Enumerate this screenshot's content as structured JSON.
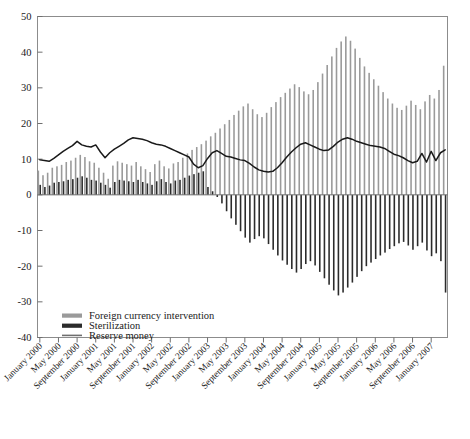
{
  "chart_data": {
    "type": "bar",
    "title": "",
    "xlabel": "",
    "ylabel": "",
    "ylim": [
      -40,
      50
    ],
    "yticks": [
      -40,
      -30,
      -20,
      -10,
      0,
      10,
      20,
      30,
      40,
      50
    ],
    "ytick_labels": [
      "-40",
      "-30",
      "-20",
      "-10",
      "0",
      "10",
      "20",
      "30",
      "40",
      "50"
    ],
    "grid": false,
    "legend_position": "lower-left-inside",
    "x_tick_interval_months": 4,
    "x": [
      "January 2000",
      "February 2000",
      "March 2000",
      "April 2000",
      "May 2000",
      "June 2000",
      "July 2000",
      "August 2000",
      "September 2000",
      "October 2000",
      "November 2000",
      "December 2000",
      "January 2001",
      "February 2001",
      "March 2001",
      "April 2001",
      "May 2001",
      "June 2001",
      "July 2001",
      "August 2001",
      "September 2001",
      "October 2001",
      "November 2001",
      "December 2001",
      "January 2002",
      "February 2002",
      "March 2002",
      "April 2002",
      "May 2002",
      "June 2002",
      "July 2002",
      "August 2002",
      "September 2002",
      "October 2002",
      "November 2002",
      "December 2002",
      "January 2003",
      "February 2003",
      "March 2003",
      "April 2003",
      "May 2003",
      "June 2003",
      "July 2003",
      "August 2003",
      "September 2003",
      "October 2003",
      "November 2003",
      "December 2003",
      "January 2004",
      "February 2004",
      "March 2004",
      "April 2004",
      "May 2004",
      "June 2004",
      "July 2004",
      "August 2004",
      "September 2004",
      "October 2004",
      "November 2004",
      "December 2004",
      "January 2005",
      "February 2005",
      "March 2005",
      "April 2005",
      "May 2005",
      "June 2005",
      "July 2005",
      "August 2005",
      "September 2005",
      "October 2005",
      "November 2005",
      "December 2005",
      "January 2006",
      "February 2006",
      "March 2006",
      "April 2006",
      "May 2006",
      "June 2006",
      "July 2006",
      "August 2006",
      "September 2006",
      "October 2006",
      "November 2006",
      "December 2006",
      "January 2007",
      "February 2007",
      "March 2007",
      "April 2007"
    ],
    "xtick_labels": [
      "January 2000",
      "May 2000",
      "September 2000",
      "January 2001",
      "May 2001",
      "September 2001",
      "January 2002",
      "May 2002",
      "September 2002",
      "January 2003",
      "May 2003",
      "September 2003",
      "January 2004",
      "May 2004",
      "September 2004",
      "January 2005",
      "May 2005",
      "September 2005",
      "January 2006",
      "May 2006",
      "September 2006",
      "January 2007"
    ],
    "series": [
      {
        "name": "Foreign currency intervention",
        "kind": "bar",
        "color": "#9a9a9a",
        "values": [
          6.8,
          5.5,
          6.2,
          7.6,
          8.0,
          8.4,
          9.2,
          9.6,
          10.4,
          11.2,
          10.6,
          9.4,
          9.0,
          7.6,
          6.2,
          4.5,
          8.2,
          9.4,
          9.0,
          8.6,
          8.2,
          9.2,
          8.0,
          7.2,
          6.4,
          8.6,
          9.6,
          8.0,
          7.4,
          8.8,
          9.2,
          10.4,
          11.6,
          12.6,
          13.4,
          14.2,
          15.2,
          16.4,
          17.4,
          18.6,
          19.8,
          21.0,
          22.4,
          23.6,
          24.8,
          25.6,
          24.0,
          22.6,
          21.8,
          23.0,
          24.6,
          26.0,
          27.4,
          28.6,
          29.8,
          31.0,
          30.2,
          29.0,
          28.2,
          29.4,
          31.6,
          34.0,
          36.4,
          38.8,
          41.2,
          43.0,
          44.4,
          43.2,
          41.0,
          38.4,
          36.0,
          34.2,
          32.4,
          30.6,
          28.8,
          27.0,
          25.6,
          24.4,
          23.8,
          25.0,
          26.4,
          25.2,
          24.0,
          26.2,
          28.0,
          27.0,
          29.4,
          36.2
        ]
      },
      {
        "name": "Sterilization",
        "kind": "bar",
        "color": "#2b2b2b",
        "values": [
          2.8,
          2.2,
          2.6,
          3.4,
          3.6,
          3.8,
          4.2,
          4.4,
          4.8,
          5.2,
          4.8,
          4.2,
          4.0,
          3.4,
          2.8,
          2.0,
          3.6,
          4.2,
          4.0,
          3.8,
          3.6,
          4.2,
          3.6,
          3.2,
          2.8,
          3.8,
          4.4,
          3.6,
          3.2,
          4.0,
          4.2,
          4.8,
          5.4,
          5.8,
          6.2,
          6.6,
          2.2,
          1.0,
          -0.6,
          -2.4,
          -4.6,
          -6.6,
          -8.4,
          -10.2,
          -12.0,
          -13.4,
          -12.4,
          -11.6,
          -12.2,
          -13.8,
          -15.4,
          -17.0,
          -18.4,
          -19.6,
          -20.8,
          -21.8,
          -20.8,
          -19.4,
          -18.6,
          -19.8,
          -21.6,
          -23.4,
          -25.2,
          -26.8,
          -28.2,
          -27.4,
          -26.0,
          -24.6,
          -23.0,
          -21.4,
          -20.0,
          -19.0,
          -18.0,
          -17.0,
          -16.2,
          -15.2,
          -14.4,
          -13.6,
          -13.2,
          -14.2,
          -15.4,
          -14.4,
          -13.4,
          -15.6,
          -17.2,
          -16.4,
          -18.6,
          -27.4
        ]
      },
      {
        "name": "Reserve money",
        "kind": "line",
        "color": "#1a1a1a",
        "values": [
          9.8,
          9.6,
          9.4,
          10.2,
          11.2,
          12.2,
          13.0,
          13.8,
          15.0,
          14.0,
          13.6,
          13.4,
          14.0,
          12.0,
          10.4,
          11.8,
          12.8,
          13.6,
          14.4,
          15.4,
          16.0,
          15.8,
          15.6,
          15.2,
          14.6,
          14.2,
          14.0,
          13.6,
          13.0,
          12.4,
          11.8,
          11.2,
          10.6,
          8.6,
          7.6,
          8.2,
          10.2,
          11.8,
          12.4,
          11.6,
          10.8,
          10.6,
          10.2,
          9.8,
          9.6,
          8.8,
          7.8,
          7.0,
          6.6,
          6.4,
          6.6,
          7.6,
          9.0,
          10.6,
          12.0,
          13.2,
          14.2,
          14.6,
          14.0,
          13.4,
          12.8,
          12.4,
          12.6,
          13.6,
          14.8,
          15.6,
          16.0,
          15.6,
          15.0,
          14.6,
          14.2,
          13.8,
          13.6,
          13.4,
          13.0,
          12.2,
          11.4,
          11.0,
          10.4,
          9.6,
          9.0,
          9.4,
          11.6,
          9.2,
          12.2,
          9.6,
          11.8,
          12.6
        ]
      }
    ]
  },
  "legend": {
    "items": [
      {
        "label": "Foreign currency intervention",
        "swatch": "bar-gray"
      },
      {
        "label": "Sterilization",
        "swatch": "bar-dark"
      },
      {
        "label": "Reserve money",
        "swatch": "line-dark"
      }
    ]
  },
  "colors": {
    "intervention": "#9a9a9a",
    "sterilization": "#2b2b2b",
    "reserve_money": "#1a1a1a",
    "frame": "#8c8c8c",
    "zero_line": "#6f6f6f",
    "text": "#1a1a1a"
  }
}
